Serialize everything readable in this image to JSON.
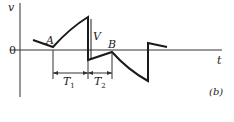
{
  "diagram": {
    "caption": "(b)",
    "axes": {
      "y_label": "v",
      "x_label": "t",
      "origin_label": "0"
    },
    "points": {
      "A": "A",
      "B": "B"
    },
    "annotations": {
      "amplitude": "V",
      "interval1": "T",
      "interval1_sub": "1",
      "interval2": "T",
      "interval2_sub": "2"
    },
    "colors": {
      "line": "#1a1a1a",
      "axis": "#333333"
    }
  }
}
